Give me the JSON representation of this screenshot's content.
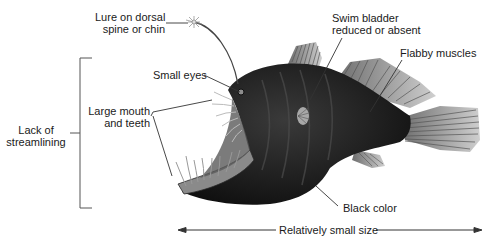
{
  "diagram": {
    "labels": {
      "lure": [
        "Lure on dorsal",
        "spine or chin"
      ],
      "eyes": "Small eyes",
      "mouth": [
        "Large mouth",
        "and teeth"
      ],
      "swim_bladder": [
        "Swim bladder",
        "reduced or absent"
      ],
      "muscles": "Flabby muscles",
      "streamlining": [
        "Lack of",
        "streamlining"
      ],
      "color": "Black color",
      "size": "Relatively small size"
    },
    "colors": {
      "body": "#1c1c1c",
      "fin": "#9a9a9a",
      "line": "#333333",
      "text": "#1a1a1a"
    }
  }
}
